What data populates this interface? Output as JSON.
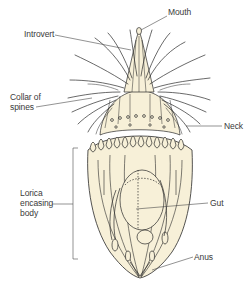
{
  "diagram": {
    "colors": {
      "body_fill": "#f7f0d8",
      "line": "#2a2a2a",
      "label_text": "#3a3a3a",
      "leader": "#4a4a4a",
      "background": "#ffffff"
    },
    "labels": {
      "mouth": "Mouth",
      "introvert": "Introvert",
      "collar_line1": "Collar of",
      "collar_line2": "spines",
      "neck": "Neck",
      "lorica_line1": "Lorica",
      "lorica_line2": "encasing",
      "lorica_line3": "body",
      "gut": "Gut",
      "anus": "Anus"
    }
  }
}
